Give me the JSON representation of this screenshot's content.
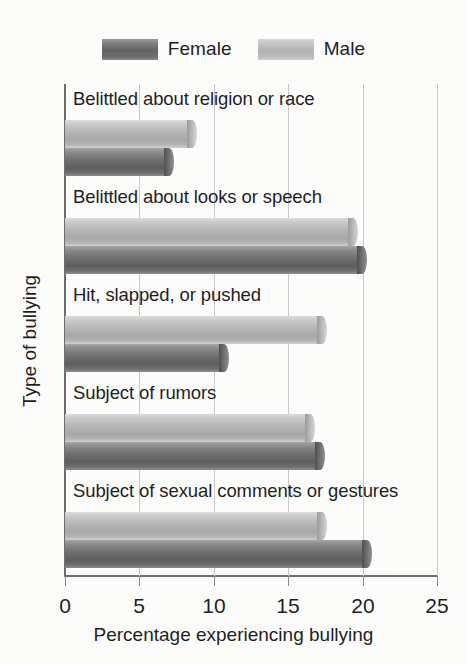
{
  "chart_data": {
    "type": "bar",
    "orientation": "horizontal",
    "title": "",
    "xlabel": "Percentage experiencing bullying",
    "ylabel": "Type of bullying",
    "xlim": [
      0,
      25
    ],
    "xticks": [
      0,
      5,
      10,
      15,
      20,
      25
    ],
    "xtick_labels": [
      "0",
      "5",
      "10",
      "15",
      "20",
      "25"
    ],
    "grid": true,
    "grid_axis": "x",
    "legend": [
      "Female",
      "Male"
    ],
    "legend_position": "top-center",
    "categories": [
      "Belittled about religion or race",
      "Belittled about looks or speech",
      "Hit, slapped, or pushed",
      "Subject of rumors",
      "Subject of sexual comments or gestures"
    ],
    "series": [
      {
        "name": "Female",
        "color": "#6e6e6e",
        "values": [
          7.3,
          20.3,
          11.0,
          17.5,
          20.6
        ]
      },
      {
        "name": "Male",
        "color": "#b6b6b6",
        "values": [
          8.9,
          19.7,
          17.6,
          16.8,
          17.6
        ]
      }
    ]
  },
  "legend": {
    "female_label": "Female",
    "male_label": "Male"
  },
  "axes": {
    "x_title": "Percentage experiencing bullying",
    "y_title": "Type of bullying",
    "tick_0": "0",
    "tick_5": "5",
    "tick_10": "10",
    "tick_15": "15",
    "tick_20": "20",
    "tick_25": "25"
  },
  "categories": {
    "c0": "Belittled about religion or race",
    "c1": "Belittled about looks or speech",
    "c2": "Hit, slapped, or pushed",
    "c3": "Subject of rumors",
    "c4": "Subject of sexual comments or gestures"
  }
}
